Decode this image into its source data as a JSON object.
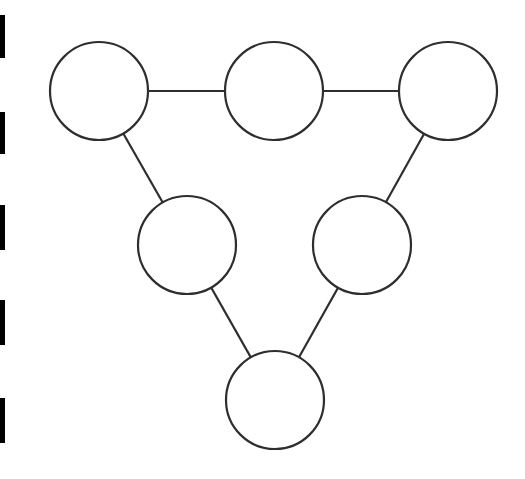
{
  "canvas": {
    "width": 525,
    "height": 479,
    "background": "#ffffff"
  },
  "style": {
    "stroke": "#2e2e2e",
    "stroke_width": 2.2,
    "node_fill": "#ffffff",
    "bar_color": "#000000"
  },
  "left_bars": [
    {
      "top": 15,
      "height": 43
    },
    {
      "top": 112,
      "height": 42
    },
    {
      "top": 205,
      "height": 45
    },
    {
      "top": 300,
      "height": 45
    },
    {
      "top": 398,
      "height": 45
    }
  ],
  "graph": {
    "nodes": [
      {
        "id": "n1",
        "cx": 99,
        "cy": 91,
        "r": 49
      },
      {
        "id": "n2",
        "cx": 274,
        "cy": 91,
        "r": 49
      },
      {
        "id": "n3",
        "cx": 448,
        "cy": 91,
        "r": 49
      },
      {
        "id": "n4",
        "cx": 187,
        "cy": 245,
        "r": 49
      },
      {
        "id": "n5",
        "cx": 362,
        "cy": 245,
        "r": 49
      },
      {
        "id": "n6",
        "cx": 275,
        "cy": 400,
        "r": 49
      }
    ],
    "edges": [
      {
        "from": "n1",
        "to": "n2"
      },
      {
        "from": "n2",
        "to": "n3"
      },
      {
        "from": "n1",
        "to": "n4"
      },
      {
        "from": "n3",
        "to": "n5"
      },
      {
        "from": "n4",
        "to": "n6"
      },
      {
        "from": "n5",
        "to": "n6"
      }
    ]
  }
}
